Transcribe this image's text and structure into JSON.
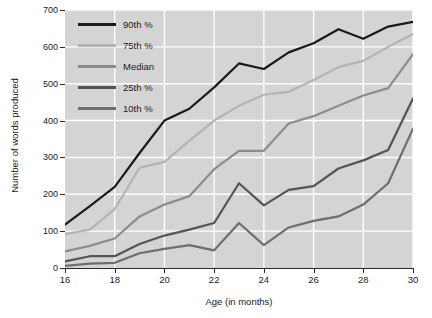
{
  "chart_data": {
    "type": "line",
    "title": "",
    "xlabel": "Age (in months)",
    "ylabel": "Number of words produced",
    "xlim": [
      16,
      30
    ],
    "ylim": [
      0,
      700
    ],
    "xticks": [
      16,
      18,
      20,
      22,
      24,
      26,
      28,
      30
    ],
    "yticks": [
      0,
      100,
      200,
      300,
      400,
      500,
      600,
      700
    ],
    "x": [
      16,
      17,
      18,
      19,
      20,
      21,
      22,
      23,
      24,
      25,
      26,
      27,
      28,
      29,
      30
    ],
    "grid": true,
    "legend_position": "upper-left",
    "series": [
      {
        "name": "90th %",
        "color": "#1a1a1a",
        "values": [
          118,
          168,
          220,
          312,
          400,
          432,
          490,
          555,
          540,
          585,
          610,
          648,
          622,
          655,
          668
        ]
      },
      {
        "name": "75th %",
        "color": "#b3b3b3",
        "values": [
          92,
          104,
          160,
          272,
          288,
          345,
          400,
          440,
          470,
          478,
          510,
          545,
          562,
          600,
          635
        ]
      },
      {
        "name": "Median",
        "color": "#8c8c8c",
        "values": [
          45,
          60,
          80,
          140,
          172,
          195,
          268,
          318,
          318,
          392,
          412,
          440,
          468,
          488,
          580
        ]
      },
      {
        "name": "25th %",
        "color": "#545454",
        "values": [
          18,
          32,
          32,
          65,
          88,
          104,
          122,
          230,
          170,
          212,
          222,
          270,
          292,
          320,
          460
        ]
      },
      {
        "name": "10th %",
        "color": "#6e6e6e",
        "values": [
          6,
          12,
          14,
          40,
          52,
          62,
          48,
          122,
          62,
          110,
          128,
          140,
          172,
          230,
          378
        ]
      }
    ]
  }
}
